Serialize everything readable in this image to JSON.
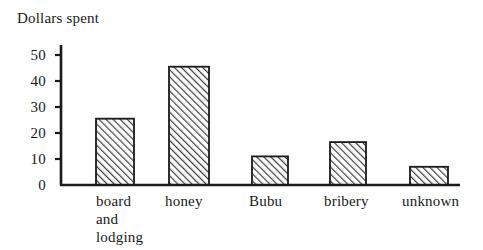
{
  "chart_data": {
    "type": "bar",
    "title": "",
    "ylabel": "Dollars spent",
    "xlabel": "",
    "categories": [
      "board\nand\nlodging",
      "honey",
      "Bubu",
      "bribery",
      "unknown"
    ],
    "values": [
      25.5,
      45.5,
      11,
      16.5,
      7
    ],
    "ylim": [
      0,
      55
    ],
    "yticks": [
      0,
      10,
      20,
      30,
      40,
      50
    ],
    "ytick_labels": [
      "0",
      "10",
      "20",
      "30",
      "40",
      "50"
    ],
    "grid": false,
    "legend": null,
    "bar_style": {
      "fill": "hatch-diagonal-forward",
      "edge_color": "#1a1a1a",
      "hatch_color": "#3a3a3a",
      "background": "#ffffff"
    },
    "axis_color": "#1a1a1a"
  },
  "geometry": {
    "baseline_y": 185,
    "axis_x": 61,
    "axis_top_y": 45,
    "axis_right_x": 460,
    "pixels_per_unit": 2.6,
    "bars": [
      {
        "x": 96,
        "width": 38,
        "label_x": 96
      },
      {
        "x": 169,
        "width": 40,
        "label_x": 165
      },
      {
        "x": 252,
        "width": 36,
        "label_x": 247
      },
      {
        "x": 330,
        "width": 36,
        "label_x": 323
      },
      {
        "x": 410,
        "width": 38,
        "label_x": 401
      }
    ]
  }
}
